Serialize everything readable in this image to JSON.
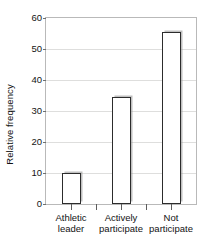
{
  "chart_data": {
    "type": "bar",
    "title": "",
    "xlabel": "",
    "ylabel": "Relative frequency",
    "categories": [
      "Athletic leader",
      "Actively participate",
      "Not participate"
    ],
    "category_lines": [
      [
        "Athletic",
        "leader"
      ],
      [
        "Actively",
        "participate"
      ],
      [
        "Not",
        "participate"
      ]
    ],
    "values": [
      10,
      34.5,
      55.5
    ],
    "ylim": [
      0,
      60
    ],
    "ytick_labels": [
      "0",
      "10",
      "20",
      "30",
      "40",
      "50",
      "60"
    ],
    "ytick_values": [
      0,
      10,
      20,
      30,
      40,
      50,
      60
    ],
    "grid": true,
    "legend": false,
    "bar_fill_color": "#ffffff",
    "bar_edge_color": "#2c2c2c",
    "gridline_color": "#dededd",
    "frame_color": "#b9b9b9"
  },
  "axes": {
    "y_title": "Relative frequency"
  },
  "ticks": {
    "y": [
      {
        "label": "60",
        "value": 60
      },
      {
        "label": "50",
        "value": 50
      },
      {
        "label": "40",
        "value": 40
      },
      {
        "label": "30",
        "value": 30
      },
      {
        "label": "20",
        "value": 20
      },
      {
        "label": "10",
        "value": 10
      },
      {
        "label": "0",
        "value": 0
      }
    ]
  },
  "bars": [
    {
      "label_line1": "Athletic",
      "label_line2": "leader",
      "value": 10
    },
    {
      "label_line1": "Actively",
      "label_line2": "participate",
      "value": 34.5
    },
    {
      "label_line1": "Not",
      "label_line2": "participate",
      "value": 55.5
    }
  ],
  "title_sliver": {
    "text": ""
  }
}
